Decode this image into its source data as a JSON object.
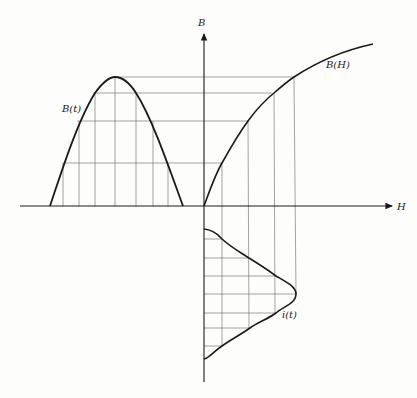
{
  "diagram": {
    "axes": {
      "vertical_label": "B",
      "horizontal_label": "H"
    },
    "curves": {
      "flux_time": "B(t)",
      "magnetization": "B(H)",
      "current_time": "i(t)"
    },
    "colors": {
      "ink": "#1a1a1a",
      "grid": "#555555",
      "background": "#fdfdfb"
    }
  }
}
